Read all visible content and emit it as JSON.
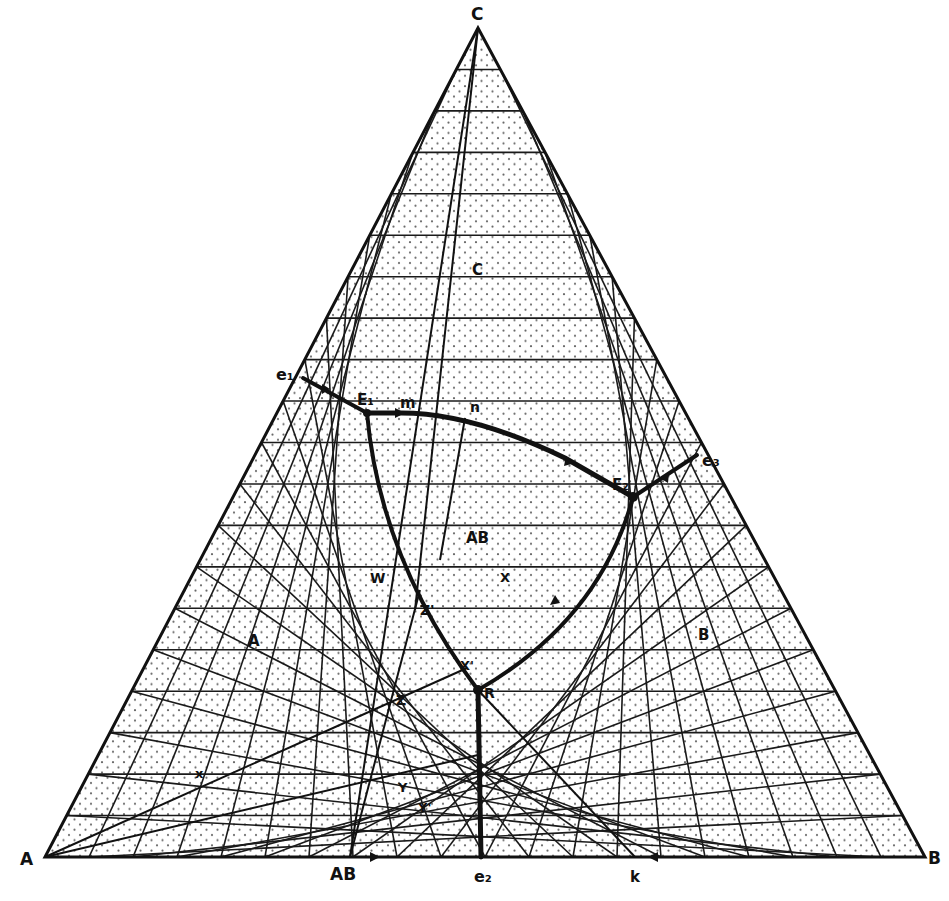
{
  "diagram": {
    "type": "ternary-phase-diagram",
    "vertices": {
      "A": {
        "label": "A",
        "x": 45,
        "y": 857
      },
      "B": {
        "label": "B",
        "x": 925,
        "y": 857
      },
      "C": {
        "label": "C",
        "x": 478,
        "y": 28
      }
    },
    "grid_divisions": 20,
    "colors": {
      "ink": "#111111",
      "paper": "#ffffff",
      "grid": "#1a1a1a",
      "dot": "#333333"
    },
    "labels": {
      "A": "A",
      "B": "B",
      "C": "C",
      "AB_vertex": "AB",
      "e1": "e₁",
      "e2": "e₂",
      "e3": "e₃",
      "E1": "E₁",
      "E2": "E₂",
      "m": "m",
      "n": "n",
      "k": "k",
      "field_A": "A",
      "field_B": "B",
      "field_C": "C",
      "field_AB": "AB",
      "W": "W",
      "X": "X",
      "Xp": "X'",
      "Y": "Y",
      "Yp": "Y'",
      "Z": "Z",
      "Zp": "Z'",
      "x": "x",
      "R": "R"
    },
    "points": {
      "e1": [
        303,
        378
      ],
      "E1": [
        367,
        413
      ],
      "m": [
        398,
        413
      ],
      "n": [
        465,
        418
      ],
      "E2": [
        633,
        497
      ],
      "e3": [
        697,
        455
      ],
      "R": [
        478,
        690
      ],
      "e2": [
        481,
        857
      ],
      "AB": [
        350,
        857
      ],
      "k": [
        635,
        857
      ],
      "Z": [
        390,
        697
      ],
      "Y": [
        400,
        775
      ],
      "x": [
        197,
        774
      ],
      "Zp": [
        415,
        610
      ],
      "Xp": [
        467,
        668
      ]
    }
  }
}
